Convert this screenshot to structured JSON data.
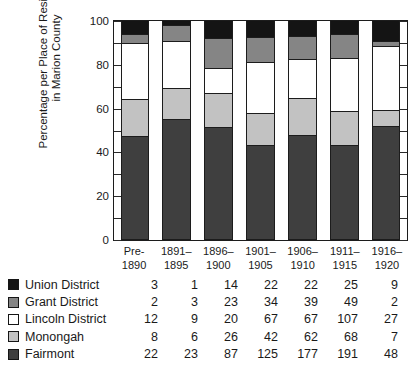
{
  "chart_data": {
    "type": "bar",
    "subtype": "stacked-bar-100-percent",
    "title": "",
    "xlabel": "",
    "ylabel": "Percentage per Place of Residence\nin Marion County",
    "ylim": [
      0,
      100
    ],
    "yticks": [
      0,
      20,
      40,
      60,
      80,
      100
    ],
    "yminorticks": [
      10,
      30,
      50,
      70,
      90
    ],
    "grid": false,
    "legend_position": "below-left",
    "categories": [
      "Pre-\n1890",
      "1891–\n1895",
      "1896–\n1900",
      "1901–\n1905",
      "1906–\n1910",
      "1911–\n1915",
      "1916–\n1920"
    ],
    "series": [
      {
        "name": "Fairmont",
        "color": "#3f3f3f",
        "counts": [
          22,
          23,
          87,
          125,
          177,
          191,
          48
        ],
        "percent": [
          46.8,
          55.0,
          51.2,
          43.1,
          47.6,
          43.1,
          51.6
        ]
      },
      {
        "name": "Monongah",
        "color": "#c2c2c2",
        "counts": [
          8,
          6,
          26,
          42,
          62,
          68,
          7
        ],
        "percent": [
          17.0,
          14.3,
          15.3,
          14.5,
          16.7,
          15.3,
          7.5
        ]
      },
      {
        "name": "Lincoln District",
        "color": "#ffffff",
        "counts": [
          12,
          9,
          20,
          67,
          67,
          107,
          27
        ],
        "percent": [
          25.5,
          21.4,
          11.8,
          23.1,
          18.0,
          24.2,
          29.0
        ]
      },
      {
        "name": "Grant District",
        "color": "#858585",
        "counts": [
          2,
          3,
          23,
          34,
          39,
          49,
          2
        ],
        "percent": [
          4.3,
          7.1,
          13.5,
          11.7,
          10.5,
          11.1,
          2.2
        ]
      },
      {
        "name": "Union District",
        "color": "#141414",
        "counts": [
          3,
          1,
          14,
          22,
          22,
          25,
          9
        ],
        "percent": [
          6.4,
          2.4,
          8.2,
          7.6,
          7.2,
          6.3,
          9.7
        ]
      }
    ],
    "stack_order_bottom_to_top": [
      "Fairmont",
      "Monongah",
      "Lincoln District",
      "Grant District",
      "Union District"
    ],
    "table_row_order_top_to_bottom": [
      "Union District",
      "Grant District",
      "Lincoln District",
      "Monongah",
      "Fairmont"
    ]
  },
  "axis": {
    "y_title": "Percentage per Place of Residence\nin Marion County",
    "y_tick_labels": [
      "100",
      "80",
      "60",
      "40",
      "20",
      "0"
    ]
  },
  "legend": {
    "rows": [
      {
        "label": "Union District",
        "swatch": "#141414",
        "values": [
          "3",
          "1",
          "14",
          "22",
          "22",
          "25",
          "9"
        ]
      },
      {
        "label": "Grant District",
        "swatch": "#858585",
        "values": [
          "2",
          "3",
          "23",
          "34",
          "39",
          "49",
          "2"
        ]
      },
      {
        "label": "Lincoln District",
        "swatch": "#ffffff",
        "values": [
          "12",
          "9",
          "20",
          "67",
          "67",
          "107",
          "27"
        ]
      },
      {
        "label": "Monongah",
        "swatch": "#c2c2c2",
        "values": [
          "8",
          "6",
          "26",
          "42",
          "62",
          "68",
          "7"
        ]
      },
      {
        "label": "Fairmont",
        "swatch": "#3f3f3f",
        "values": [
          "22",
          "23",
          "87",
          "125",
          "177",
          "191",
          "48"
        ]
      }
    ]
  },
  "xaxis": {
    "labels": [
      "Pre-\n1890",
      "1891–\n1895",
      "1896–\n1900",
      "1901–\n1905",
      "1906–\n1910",
      "1911–\n1915",
      "1916–\n1920"
    ]
  }
}
